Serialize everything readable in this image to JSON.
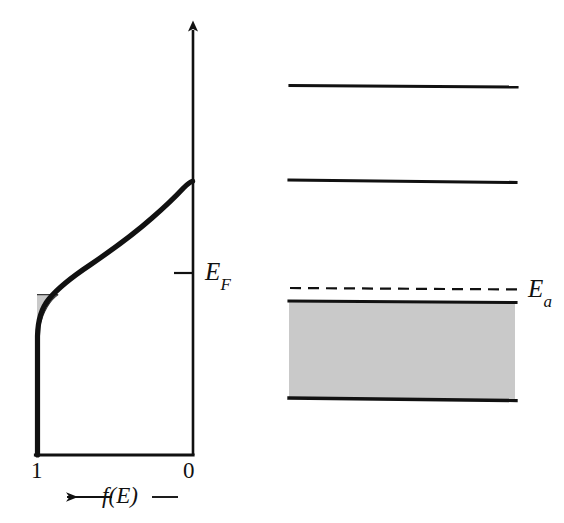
{
  "figure": {
    "background_color": "#ffffff",
    "ink_color": "#111111",
    "shade_color": "#c9c9c9"
  },
  "left_plot": {
    "name": "fermi-dirac-distribution",
    "vertical_axis": {
      "name": "energy-axis",
      "has_arrow_head": true,
      "direction": "up"
    },
    "tick_labels": {
      "left_value": "1",
      "right_value": "0"
    },
    "axis_caption": "←—f(E)—",
    "markers": [
      {
        "name": "fermi-level-tick",
        "label": "E",
        "subscript": "F",
        "description": "tick mark on vertical axis marking the Fermi level"
      }
    ],
    "shaded_region": {
      "name": "occupied-acceptor-states-shading",
      "description": "small shaded wedge between f(E)=1 edge and the distribution curve"
    }
  },
  "right_plot": {
    "name": "energy-band-diagram",
    "levels": [
      {
        "name": "conduction-band-upper-line",
        "style": "solid",
        "label": ""
      },
      {
        "name": "conduction-band-lower-line",
        "style": "solid",
        "label": ""
      },
      {
        "name": "acceptor-level-dashed-line",
        "style": "dashed",
        "label": "E",
        "subscript": "a"
      },
      {
        "name": "valence-band-top-line",
        "style": "solid",
        "label": ""
      },
      {
        "name": "valence-band-bottom-line",
        "style": "solid",
        "label": ""
      }
    ],
    "shaded_band": {
      "name": "valence-band-shading",
      "description": "filled valence band region shaded gray"
    }
  },
  "labels": {
    "fermi_level": {
      "main": "E",
      "sub": "F"
    },
    "acceptor_level": {
      "main": "E",
      "sub": "a"
    }
  }
}
